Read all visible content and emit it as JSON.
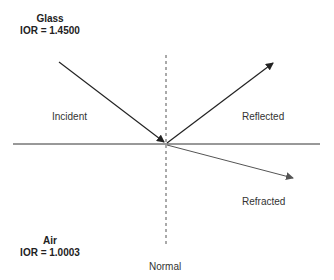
{
  "media": {
    "top": {
      "name": "Glass",
      "ior_text": "IOR = 1.4500"
    },
    "bottom": {
      "name": "Air",
      "ior_text": "IOR = 1.0003"
    }
  },
  "rays": {
    "incident": "Incident",
    "reflected": "Reflected",
    "refracted": "Refracted",
    "normal": "Normal"
  },
  "colors": {
    "line": "#333333",
    "refracted": "#555555",
    "normal_dash": "#555555"
  }
}
